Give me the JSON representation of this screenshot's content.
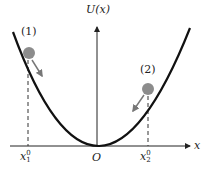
{
  "axis": {
    "y_label": "U(x)",
    "x_label": "x",
    "origin_label": "O"
  },
  "positions": {
    "x1": {
      "base": "x",
      "sub": "1",
      "sup": "0"
    },
    "x2": {
      "base": "x",
      "sub": "2",
      "sup": "0"
    }
  },
  "balls": [
    {
      "label": "(1)",
      "color": "#8c8c8c"
    },
    {
      "label": "(2)",
      "color": "#8c8c8c"
    }
  ],
  "colors": {
    "curve": "#111111",
    "axis": "#222222",
    "dashed": "#333333",
    "arrow": "#777777"
  }
}
